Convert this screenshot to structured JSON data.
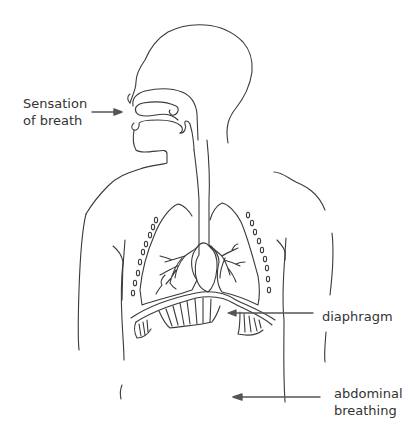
{
  "diagram": {
    "colors": {
      "line": "#3a3a3a",
      "arrow": "#555555",
      "text": "#333333",
      "background": "#ffffff"
    },
    "labels": {
      "breath": {
        "line1": "Sensation",
        "line2": "of breath",
        "target": "nose/mouth"
      },
      "diaphragm": {
        "text": "diaphragm",
        "target": "diaphragm"
      },
      "abdominal": {
        "line1": "abdominal",
        "line2": "breathing",
        "target": "abdomen"
      }
    },
    "parts": [
      "head",
      "nasal-cavity",
      "mouth",
      "trachea",
      "left-lung",
      "right-lung",
      "heart",
      "ribs",
      "diaphragm",
      "torso",
      "arms"
    ]
  }
}
